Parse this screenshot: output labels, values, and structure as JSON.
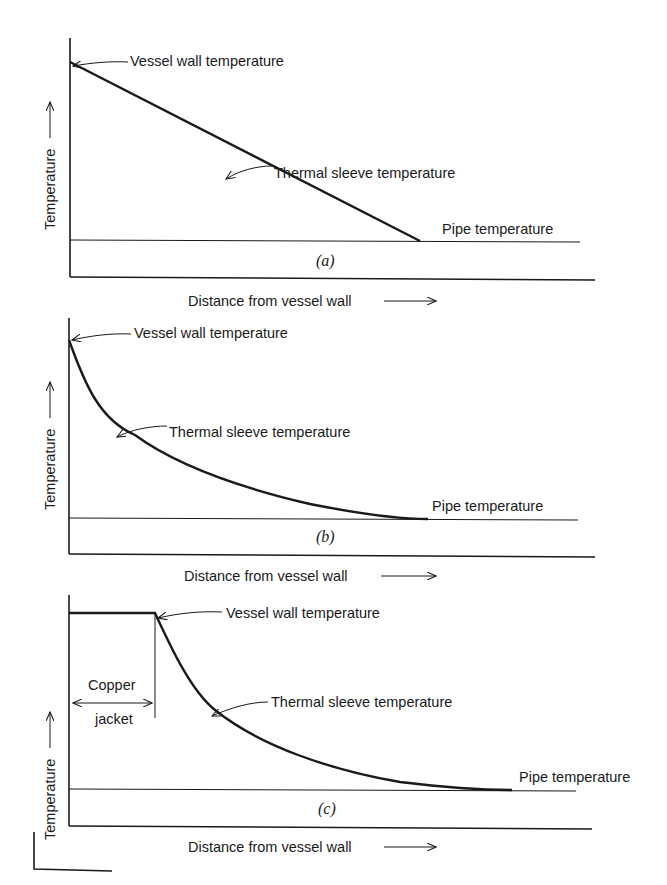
{
  "figure": {
    "panels": [
      {
        "id": "a",
        "panel_label": "(a)",
        "y_axis_label": "Temperature",
        "x_axis_label": "Distance from vessel wall",
        "annotations": {
          "vessel": "Vessel wall temperature",
          "sleeve": "Thermal sleeve temperature",
          "pipe": "Pipe temperature"
        },
        "profile": "linear"
      },
      {
        "id": "b",
        "panel_label": "(b)",
        "y_axis_label": "Temperature",
        "x_axis_label": "Distance from vessel wall",
        "annotations": {
          "vessel": "Vessel wall temperature",
          "sleeve": "Thermal sleeve temperature",
          "pipe": "Pipe temperature"
        },
        "profile": "exponential decay"
      },
      {
        "id": "c",
        "panel_label": "(c)",
        "y_axis_label": "Temperature",
        "x_axis_label": "Distance from vessel wall",
        "annotations": {
          "vessel": "Vessel wall temperature",
          "sleeve": "Thermal sleeve temperature",
          "pipe": "Pipe temperature",
          "copper_top": "Copper",
          "copper_bottom": "jacket"
        },
        "profile": "flat over copper jacket then exponential decay"
      }
    ]
  },
  "colors": {
    "ink": "#1a1a1a",
    "background": "#ffffff"
  }
}
